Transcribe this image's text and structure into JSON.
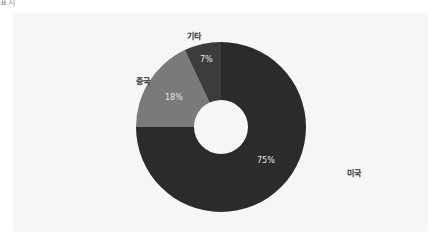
{
  "corner_label": "표시",
  "chart_data": {
    "type": "pie",
    "subtype": "donut",
    "title": "",
    "categories": [
      "미국",
      "중국",
      "기타"
    ],
    "values": [
      75,
      18,
      7
    ],
    "value_labels": [
      "75%",
      "18%",
      "7%"
    ],
    "colors": [
      "#2b2b2b",
      "#7a7a7a",
      "#3c3c3c"
    ],
    "start_angle": "12 o'clock",
    "direction": "clockwise",
    "legend": "none (labels placed outside slices)"
  },
  "labels": {
    "usa": "미국",
    "china": "중국",
    "other": "기타",
    "usa_pct": "75%",
    "china_pct": "18%",
    "other_pct": "7%"
  }
}
